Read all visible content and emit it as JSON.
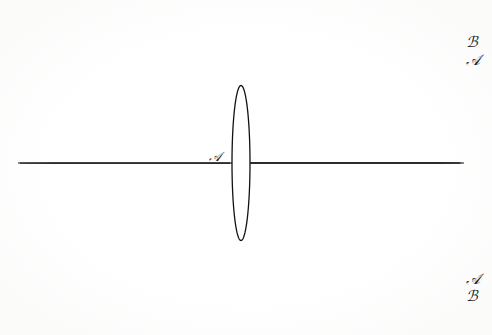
{
  "figure": {
    "kind": "conformal-flow-grid",
    "background_color": "#ffffff",
    "grid_line_color": "#6b6b6b",
    "heavy_line_color": "#1a1a1a",
    "airfoil_color": "#111111",
    "canvas": {
      "width": 492,
      "height": 335
    }
  },
  "labels": {
    "top_right_outer": "ℬ",
    "top_right_inner": "𝒜",
    "bottom_right_outer": "ℬ",
    "bottom_right_inner": "𝒜",
    "stagnation": "𝒜"
  },
  "label_positions": {
    "top_right_outer": {
      "x": 466,
      "y": 35
    },
    "top_right_inner": {
      "x": 466,
      "y": 53
    },
    "bottom_right_inner": {
      "x": 466,
      "y": 272
    },
    "bottom_right_outer": {
      "x": 466,
      "y": 289
    },
    "stagnation": {
      "x": 209,
      "y": 150
    }
  },
  "chart_data": {
    "type": "line",
    "title": "",
    "xlabel": "",
    "ylabel": "",
    "grid": true,
    "legend": "none",
    "airfoil": {
      "leading_edge": {
        "x": 241,
        "y": 88
      },
      "trailing_edge": {
        "x": 241,
        "y": 243
      },
      "max_half_thickness": 9,
      "chord_pixels": 155,
      "center": {
        "x": 241,
        "y": 163
      }
    },
    "centerline": {
      "y": 162,
      "x_start": 20,
      "x_end": 462,
      "emphasis": "heavy"
    },
    "stream_band_top": {
      "y": 58,
      "emphasis": "medium"
    },
    "stream_band_bottom": {
      "y": 277,
      "emphasis": "medium"
    },
    "grid_bounds": {
      "x_min": 20,
      "x_max": 462,
      "y_min": 17,
      "y_max": 320
    },
    "stream_count": 40,
    "potential_count": 64
  }
}
